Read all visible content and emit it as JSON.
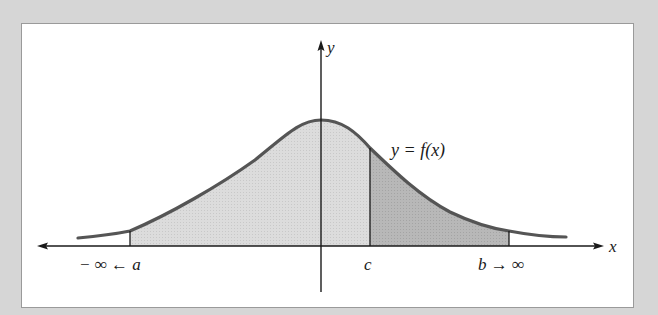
{
  "diagram": {
    "type": "area-under-curve",
    "curve_label": "y = f(x)",
    "axes": {
      "x_label": "x",
      "y_label": "y"
    },
    "markers": {
      "a_label": "− ∞ ← a",
      "c_label": "c",
      "b_label": "b → ∞"
    },
    "regions": [
      {
        "name": "left-region",
        "from": "a",
        "to": "c",
        "fill": "#d9d9d9"
      },
      {
        "name": "right-region",
        "from": "c",
        "to": "b",
        "fill": "#b3b3b3"
      }
    ],
    "colors": {
      "background": "#d6d6d6",
      "frame": "#ffffff",
      "curve": "#555555",
      "axis": "#1a1a1a"
    }
  }
}
